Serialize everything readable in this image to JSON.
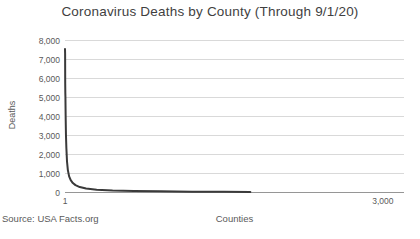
{
  "title": "Coronavirus Deaths by County (Through 9/1/20)",
  "source_note": "Source: USA Facts.org",
  "colors": {
    "title_text": "#3f3f3f",
    "axis_text": "#595959",
    "gridline": "#d9d9d9",
    "axis_line": "#969696",
    "series_line": "#3a3a3a",
    "background": "#ffffff"
  },
  "chart_data": {
    "type": "line",
    "title": "Coronavirus Deaths by County (Through 9/1/20)",
    "xlabel": "Counties",
    "ylabel": "Deaths",
    "xlim": [
      1,
      3200
    ],
    "ylim": [
      0,
      8000
    ],
    "grid": "horizontal-only",
    "legend": "none",
    "yticks": [
      {
        "value": 0,
        "label": "0"
      },
      {
        "value": 1000,
        "label": "1,000"
      },
      {
        "value": 2000,
        "label": "2,000"
      },
      {
        "value": 3000,
        "label": "3,000"
      },
      {
        "value": 4000,
        "label": "4,000"
      },
      {
        "value": 5000,
        "label": "5,000"
      },
      {
        "value": 6000,
        "label": "6,000"
      },
      {
        "value": 7000,
        "label": "7,000"
      },
      {
        "value": 8000,
        "label": "8,000"
      }
    ],
    "xticks": [
      {
        "value": 1,
        "label": "1"
      },
      {
        "value": 3000,
        "label": "3,000"
      }
    ],
    "series": [
      {
        "name": "Deaths by county rank",
        "points": [
          [
            1,
            7500
          ],
          [
            2,
            7250
          ],
          [
            3,
            5700
          ],
          [
            4,
            5200
          ],
          [
            5,
            5000
          ],
          [
            7,
            4000
          ],
          [
            10,
            3000
          ],
          [
            14,
            2300
          ],
          [
            20,
            1600
          ],
          [
            28,
            1150
          ],
          [
            40,
            820
          ],
          [
            55,
            620
          ],
          [
            75,
            470
          ],
          [
            100,
            360
          ],
          [
            140,
            260
          ],
          [
            200,
            185
          ],
          [
            300,
            120
          ],
          [
            450,
            78
          ],
          [
            650,
            50
          ],
          [
            900,
            33
          ],
          [
            1200,
            19
          ],
          [
            1500,
            9
          ],
          [
            1750,
            1
          ]
        ]
      }
    ]
  }
}
